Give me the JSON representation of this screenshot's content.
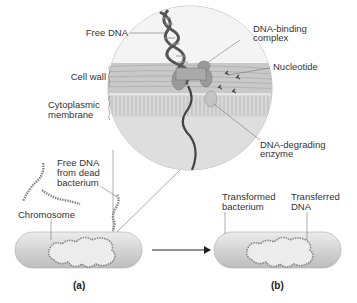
{
  "diagram": {
    "magnified_view_labels": {
      "free_dna": "Free DNA",
      "cell_wall": "Cell wall",
      "cytoplasmic_membrane_line1": "Cytoplasmic",
      "cytoplasmic_membrane_line2": "membrane",
      "dna_binding_line1": "DNA-binding",
      "dna_binding_line2": "complex",
      "nucleotide": "Nucleotide",
      "dna_degrading_line1": "DNA-degrading",
      "dna_degrading_line2": "enzyme"
    },
    "panel_a": {
      "free_dna_line1": "Free DNA",
      "free_dna_line2": "from dead",
      "free_dna_line3": "bacterium",
      "chromosome": "Chromosome",
      "label": "(a)"
    },
    "panel_b": {
      "transformed_line1": "Transformed",
      "transformed_line2": "bacterium",
      "transferred_line1": "Transferred",
      "transferred_line2": "DNA",
      "label": "(b)"
    },
    "colors": {
      "cell_fill": "#d6d6d6",
      "circle_fill": "#e4e4e4",
      "membrane": "#c8c8c8",
      "dna_dark": "#555555",
      "line": "#777777"
    }
  }
}
